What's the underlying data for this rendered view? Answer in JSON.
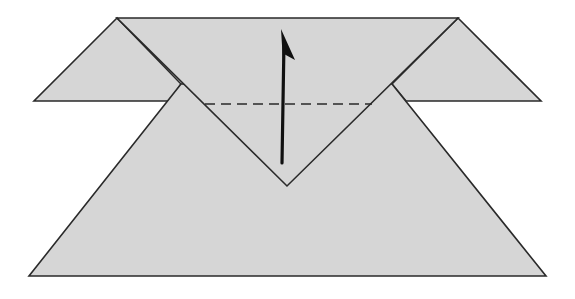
{
  "diagram": {
    "type": "origami-fold-step",
    "colors": {
      "paper": "#d6d6d6",
      "line": "#2a2a2a",
      "arrow": "#111111",
      "background": "#ffffff"
    },
    "elements": [
      {
        "name": "left-flap",
        "kind": "triangle"
      },
      {
        "name": "right-flap",
        "kind": "triangle"
      },
      {
        "name": "top-band",
        "kind": "polygon"
      },
      {
        "name": "bottom-trapezoid",
        "kind": "polygon"
      },
      {
        "name": "valley-fold-line",
        "kind": "dashed-line"
      },
      {
        "name": "fold-up-arrow",
        "kind": "arrow",
        "direction": "up"
      }
    ]
  }
}
